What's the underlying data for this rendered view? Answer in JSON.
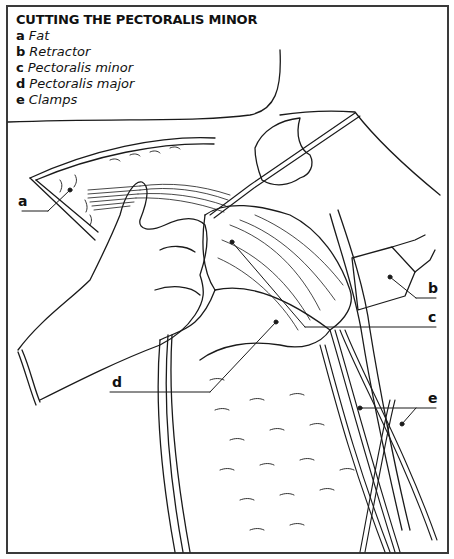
{
  "figure": {
    "title": "CUTTING THE PECTORALIS MINOR",
    "legend": [
      {
        "key": "a",
        "label": "Fat"
      },
      {
        "key": "b",
        "label": "Retractor"
      },
      {
        "key": "c",
        "label": "Pectoralis minor"
      },
      {
        "key": "d",
        "label": "Pectoralis major"
      },
      {
        "key": "e",
        "label": "Clamps"
      }
    ],
    "callouts": {
      "a": "a",
      "b": "b",
      "c": "c",
      "d": "d",
      "e": "e"
    },
    "colors": {
      "line": "#1a1a1a",
      "frame": "#3a3a3a",
      "background": "#ffffff"
    }
  }
}
